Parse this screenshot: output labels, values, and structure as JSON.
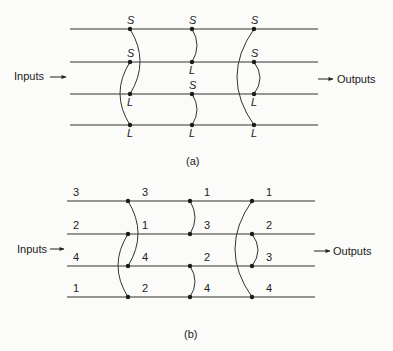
{
  "diagram_a": {
    "caption": "(a)",
    "inputs_label": "Inputs",
    "outputs_label": "Outputs",
    "line_y": [
      29,
      62,
      94,
      125
    ],
    "line_x": [
      70,
      318
    ],
    "stages": [
      {
        "x": 130,
        "comparators": [
          {
            "from_line": 0,
            "to_line": 2,
            "top_label": "S",
            "bottom_label": "L",
            "bulge": 10
          },
          {
            "from_line": 1,
            "to_line": 3,
            "top_label": "S",
            "bottom_label": "L",
            "bulge": -10
          }
        ]
      },
      {
        "x": 192,
        "comparators": [
          {
            "from_line": 0,
            "to_line": 1,
            "top_label": "S",
            "bottom_label": "L",
            "bulge": 5
          },
          {
            "from_line": 2,
            "to_line": 3,
            "top_label": "S",
            "bottom_label": "L",
            "bulge": 5
          }
        ]
      },
      {
        "x": 254,
        "comparators": [
          {
            "from_line": 0,
            "to_line": 3,
            "top_label": "S",
            "bottom_label": "L",
            "bulge": -17
          },
          {
            "from_line": 1,
            "to_line": 2,
            "top_label": "S",
            "bottom_label": "L",
            "bulge": 6
          }
        ]
      }
    ]
  },
  "diagram_b": {
    "caption": "(b)",
    "inputs_label": "Inputs",
    "outputs_label": "Outputs",
    "line_y": [
      201,
      234,
      266,
      297
    ],
    "line_x": [
      67,
      315
    ],
    "input_values": [
      "3",
      "2",
      "4",
      "1"
    ],
    "stage_outputs": [
      {
        "x": 128,
        "values": [
          "3",
          "1",
          "4",
          "2"
        ]
      },
      {
        "x": 190,
        "values": [
          "1",
          "3",
          "2",
          "4"
        ]
      },
      {
        "x": 252,
        "values": [
          "1",
          "2",
          "3",
          "4"
        ]
      }
    ],
    "stages": [
      {
        "x": 128,
        "comparators": [
          {
            "from_line": 0,
            "to_line": 2,
            "bulge": 10
          },
          {
            "from_line": 1,
            "to_line": 3,
            "bulge": -10
          }
        ]
      },
      {
        "x": 190,
        "comparators": [
          {
            "from_line": 0,
            "to_line": 1,
            "bulge": 5
          },
          {
            "from_line": 2,
            "to_line": 3,
            "bulge": 5
          }
        ]
      },
      {
        "x": 252,
        "comparators": [
          {
            "from_line": 0,
            "to_line": 3,
            "bulge": -17
          },
          {
            "from_line": 1,
            "to_line": 2,
            "bulge": 6
          }
        ]
      }
    ]
  }
}
